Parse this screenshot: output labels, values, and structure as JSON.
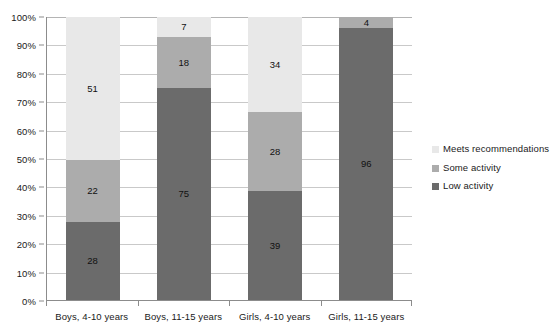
{
  "chart_data": {
    "type": "bar",
    "subtype": "stacked-percentage",
    "title": "",
    "xlabel": "",
    "ylabel": "",
    "ylim": [
      0,
      100
    ],
    "yticks": [
      "0%",
      "10%",
      "20%",
      "30%",
      "40%",
      "50%",
      "60%",
      "70%",
      "80%",
      "90%",
      "100%"
    ],
    "grid": true,
    "legend_position": "right",
    "categories": [
      "Boys, 4-10 years",
      "Boys, 11-15 years",
      "Girls, 4-10 years",
      "Girls, 11-15 years"
    ],
    "series": [
      {
        "name": "Low activity",
        "color": "#6b6b6b",
        "values": [
          28,
          75,
          39,
          96
        ],
        "labels": [
          "28",
          "75",
          "39",
          "96"
        ]
      },
      {
        "name": "Some activity",
        "color": "#acacac",
        "values": [
          22,
          18,
          28,
          4
        ],
        "labels": [
          "22",
          "18",
          "28",
          "4"
        ]
      },
      {
        "name": "Meets recommendations",
        "color": "#e8e8e8",
        "values": [
          51,
          7,
          34,
          0
        ],
        "labels": [
          "51",
          "7",
          "34",
          ""
        ]
      }
    ]
  },
  "legend": {
    "items": [
      {
        "label": "Meets recommendations",
        "color": "#e8e8e8"
      },
      {
        "label": "Some activity",
        "color": "#acacac"
      },
      {
        "label": "Low activity",
        "color": "#6b6b6b"
      }
    ]
  },
  "colors": {
    "meets_recommendations": "#e8e8e8",
    "some_activity": "#acacac",
    "low_activity": "#6b6b6b",
    "gridline": "#c9c9c9",
    "axis": "#8c8c8c",
    "text": "#1a1a1a",
    "background": "#ffffff"
  }
}
